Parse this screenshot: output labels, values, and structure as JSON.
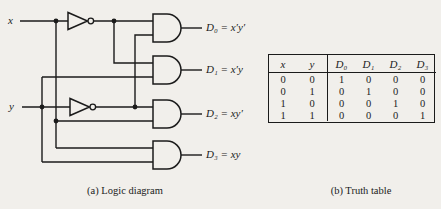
{
  "colors": {
    "background": "#f1efeb",
    "ink": "#1b1b1b"
  },
  "diagram": {
    "caption": "(a) Logic diagram",
    "inputs": {
      "x": "x",
      "y": "y"
    },
    "gates": [
      "NOT",
      "NOT",
      "AND",
      "AND",
      "AND",
      "AND"
    ],
    "outputs": [
      {
        "label": "D₀ = x′y′"
      },
      {
        "label": "D₁ = x′y"
      },
      {
        "label": "D₂ = xy′"
      },
      {
        "label": "D₃ = xy"
      }
    ]
  },
  "truth_table": {
    "caption": "(b) Truth table",
    "headers": [
      "x",
      "y",
      "D₀",
      "D₁",
      "D₂",
      "D₃"
    ],
    "rows": [
      [
        "0",
        "0",
        "1",
        "0",
        "0",
        "0"
      ],
      [
        "0",
        "1",
        "0",
        "1",
        "0",
        "0"
      ],
      [
        "1",
        "0",
        "0",
        "0",
        "1",
        "0"
      ],
      [
        "1",
        "1",
        "0",
        "0",
        "0",
        "1"
      ]
    ]
  }
}
